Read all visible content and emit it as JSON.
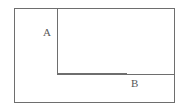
{
  "figure": {
    "kind": "line-diagram",
    "background_color": "#ffffff",
    "stroke_color": "#6e6e6e",
    "stroke_width": 1.4,
    "canvas": {
      "width": 188,
      "height": 112
    },
    "outer_rectangle": {
      "name": "outer-rectangle",
      "x": 14,
      "y": 8,
      "width": 161,
      "height": 95
    },
    "inner_lines": [
      {
        "name": "vertical-divider",
        "x1": 57,
        "y1": 8,
        "x2": 57,
        "y2": 74
      },
      {
        "name": "horizontal-divider",
        "x1": 57,
        "y1": 74,
        "x2": 175,
        "y2": 74
      }
    ],
    "labels": [
      {
        "id": "A",
        "text": "A",
        "x": 43,
        "y": 27,
        "color": "#585858"
      },
      {
        "id": "B",
        "text": "B",
        "x": 131,
        "y": 78,
        "color": "#585858"
      }
    ]
  }
}
